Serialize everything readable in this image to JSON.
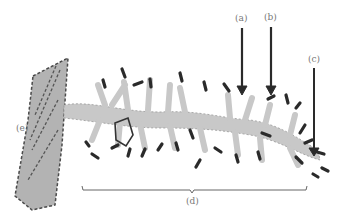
{
  "figure": {
    "colors": {
      "cell_fill": "#b3b3b3",
      "dendrite_fill": "#c8c8c8",
      "outline": "#4a4a4a",
      "spine_head": "#2a2a2a",
      "arrow": "#2a2a2a",
      "label": "#777777",
      "bracket": "#666666"
    },
    "labels": {
      "a": "(a)",
      "b": "(b)",
      "c": "(c)",
      "d": "(d)",
      "e": "(e)"
    }
  }
}
